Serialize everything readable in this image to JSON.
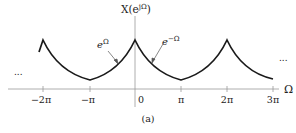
{
  "figure": {
    "caption": "(a)",
    "y_axis_label_main": "X(e",
    "y_axis_label_sup": "jΩ",
    "y_axis_label_close": ")",
    "x_axis_label": "Ω",
    "left_ellipsis": "...",
    "right_ellipsis": "...",
    "annotations": [
      {
        "base": "e",
        "sup": "Ω"
      },
      {
        "base": "e",
        "sup": "−Ω"
      }
    ],
    "ticks": [
      "−2π",
      "−π",
      "0",
      "π",
      "2π",
      "3π"
    ],
    "colors": {
      "curve": "#1a1a1a",
      "axis": "#999999",
      "text": "#222222"
    }
  }
}
